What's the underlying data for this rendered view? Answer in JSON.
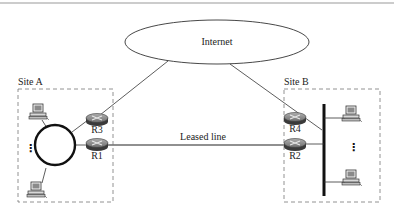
{
  "diagram": {
    "cloud": {
      "label": "Internet"
    },
    "sites": [
      {
        "id": "site-a",
        "label": "Site A",
        "topology": "ring",
        "hosts": 2,
        "ellipsis": "⋮"
      },
      {
        "id": "site-b",
        "label": "Site B",
        "topology": "bus",
        "hosts": 2,
        "ellipsis": "⋮"
      }
    ],
    "routers": [
      {
        "id": "R1",
        "label": "R1",
        "site": "Site A"
      },
      {
        "id": "R2",
        "label": "R2",
        "site": "Site B"
      },
      {
        "id": "R3",
        "label": "R3",
        "site": "Site A"
      },
      {
        "id": "R4",
        "label": "R4",
        "site": "Site B"
      }
    ],
    "links": [
      {
        "from": "R3",
        "to": "Internet"
      },
      {
        "from": "R4",
        "to": "Internet"
      },
      {
        "from": "R1",
        "to": "R2",
        "label": "Leased line"
      }
    ],
    "leased_line_label": "Leased line",
    "colors": {
      "line": "#222222",
      "router": "#7a7a7a",
      "box": "#777777",
      "rule": "#999999"
    }
  }
}
